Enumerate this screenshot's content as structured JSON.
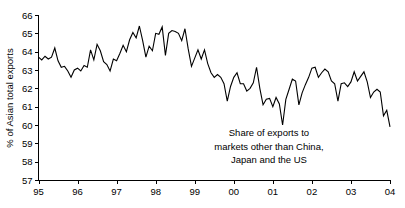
{
  "chart_data": {
    "type": "line",
    "title": "",
    "subtitle": "",
    "xlabel": "",
    "ylabel": "% of Asian total exports",
    "ylim": [
      57,
      66
    ],
    "xlim": [
      1995.0,
      2004.0
    ],
    "grid": false,
    "legend": null,
    "y_ticks": [
      "66",
      "65",
      "64",
      "63",
      "62",
      "61",
      "60",
      "59",
      "58",
      "57"
    ],
    "y_tick_values": [
      66,
      65,
      64,
      63,
      62,
      61,
      60,
      59,
      58,
      57
    ],
    "x_ticks": [
      "95",
      "96",
      "97",
      "98",
      "99",
      "00",
      "01",
      "02",
      "03",
      "04"
    ],
    "x_tick_values": [
      1995,
      1996,
      1997,
      1998,
      1999,
      2000,
      2001,
      2002,
      2003,
      2004
    ],
    "annotations": [
      {
        "name": "series-annotation",
        "lines": [
          "Share of exports to",
          "markets other than China,",
          "Japan and the US"
        ],
        "x": 2000.9,
        "y": 59.4
      }
    ],
    "series": [
      {
        "name": "Share of exports to markets other than China, Japan and the US",
        "color": "#000000",
        "x": [
          1995.0,
          1995.083,
          1995.167,
          1995.25,
          1995.333,
          1995.417,
          1995.5,
          1995.583,
          1995.667,
          1995.75,
          1995.833,
          1995.917,
          1996.0,
          1996.083,
          1996.167,
          1996.25,
          1996.333,
          1996.417,
          1996.5,
          1996.583,
          1996.667,
          1996.75,
          1996.833,
          1996.917,
          1997.0,
          1997.083,
          1997.167,
          1997.25,
          1997.333,
          1997.417,
          1997.5,
          1997.583,
          1997.667,
          1997.75,
          1997.833,
          1997.917,
          1998.0,
          1998.083,
          1998.167,
          1998.25,
          1998.333,
          1998.417,
          1998.5,
          1998.583,
          1998.667,
          1998.75,
          1998.833,
          1998.917,
          1999.0,
          1999.083,
          1999.167,
          1999.25,
          1999.333,
          1999.417,
          1999.5,
          1999.583,
          1999.667,
          1999.75,
          1999.833,
          1999.917,
          2000.0,
          2000.083,
          2000.167,
          2000.25,
          2000.333,
          2000.417,
          2000.5,
          2000.583,
          2000.667,
          2000.75,
          2000.833,
          2000.917,
          2001.0,
          2001.083,
          2001.167,
          2001.25,
          2001.333,
          2001.417,
          2001.5,
          2001.583,
          2001.667,
          2001.75,
          2001.833,
          2001.917,
          2002.0,
          2002.083,
          2002.167,
          2002.25,
          2002.333,
          2002.417,
          2002.5,
          2002.583,
          2002.667,
          2002.75,
          2002.833,
          2002.917,
          2003.0,
          2003.083,
          2003.167,
          2003.25,
          2003.333,
          2003.417,
          2003.5,
          2003.583,
          2003.667,
          2003.75,
          2003.833,
          2003.917,
          2004.0
        ],
        "values": [
          63.7,
          63.55,
          63.75,
          63.6,
          63.7,
          64.2,
          63.5,
          63.15,
          63.2,
          62.95,
          62.6,
          63.0,
          63.1,
          62.95,
          63.25,
          63.15,
          64.1,
          63.55,
          64.4,
          64.05,
          63.45,
          63.3,
          62.95,
          63.6,
          63.5,
          63.9,
          64.35,
          64.0,
          64.65,
          65.05,
          64.75,
          65.4,
          64.6,
          63.7,
          64.3,
          64.05,
          65.0,
          64.95,
          65.35,
          63.8,
          65.0,
          65.15,
          65.1,
          65.0,
          64.6,
          65.25,
          64.15,
          63.2,
          63.65,
          64.1,
          63.6,
          64.1,
          63.35,
          62.85,
          62.6,
          62.75,
          62.6,
          62.25,
          61.3,
          62.1,
          62.6,
          62.85,
          62.25,
          62.25,
          61.85,
          62.0,
          62.3,
          63.15,
          62.0,
          61.1,
          61.4,
          61.45,
          61.0,
          61.5,
          61.15,
          60.0,
          61.4,
          61.95,
          62.5,
          62.4,
          61.1,
          61.75,
          62.2,
          62.6,
          63.1,
          63.15,
          62.6,
          62.85,
          63.05,
          62.9,
          62.4,
          62.25,
          61.3,
          62.25,
          62.3,
          62.1,
          62.35,
          62.9,
          62.4,
          62.65,
          62.9,
          62.35,
          61.5,
          61.8,
          61.95,
          61.8,
          60.5,
          60.8,
          59.9
        ]
      }
    ]
  }
}
